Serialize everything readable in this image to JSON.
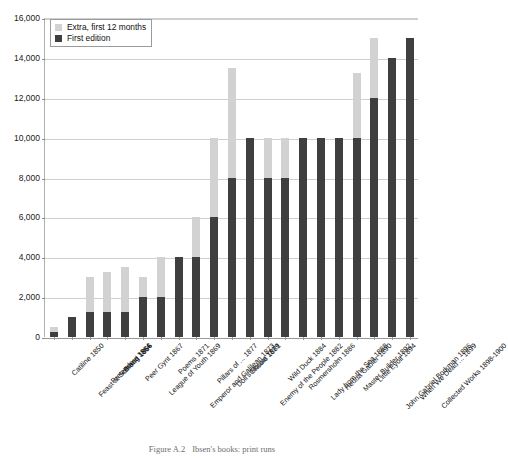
{
  "figure": {
    "caption_number": "Figure A.2",
    "caption_text": "Ibsen's books: print runs"
  },
  "legend": {
    "position": "top-left-inside",
    "items": [
      {
        "label": "Extra, first 12 months",
        "color": "#d2d2d2",
        "swatch": "legend-swatch-extra"
      },
      {
        "label": "First edition",
        "color": "#3f3f3f",
        "swatch": "legend-swatch-first"
      }
    ]
  },
  "axes": {
    "y_ticks": [
      "0",
      "2,000",
      "4,000",
      "6,000",
      "8,000",
      "10,000",
      "12,000",
      "14,000",
      "16,000"
    ],
    "y_min": 0,
    "y_max": 16000,
    "y_step": 2000,
    "grid": true
  },
  "chart_data": {
    "type": "bar",
    "subtype": "stacked-vertical",
    "title": "Ibsen's books: print runs",
    "xlabel": "",
    "ylabel": "",
    "ylim": [
      0,
      16000
    ],
    "ytick_step": 2000,
    "grid": true,
    "legend_position": "top-left-inside",
    "categories": [
      "Catiline 1850",
      "Feast at Solhoug 1856",
      "Pretenders 1864",
      "Brand 1866",
      "Peer Gynt 1867",
      "League of Youth 1869",
      "Poems 1871",
      "Emperor and Galilean 1873",
      "Pillars of ... 1877",
      "Doll's House 1879",
      "Ghosts 1881",
      "Enemy of the People 1882",
      "Wild Duck 1884",
      "Rosmersholm 1886",
      "Lady from the Sea 1888",
      "Hedda Gabler 1890",
      "Master Builder 1892",
      "Little Eyolf 1894",
      "John Gabriel Borkman 1896",
      "When We Dead ... 1899",
      "Collected Works 1898-1900"
    ],
    "series": [
      {
        "name": "First edition",
        "color": "#3f3f3f",
        "values": [
          250,
          1000,
          1250,
          1250,
          1250,
          2000,
          2000,
          4000,
          4000,
          6000,
          8000,
          10000,
          8000,
          8000,
          10000,
          10000,
          10000,
          10000,
          12000,
          14000,
          15000
        ]
      },
      {
        "name": "Extra, first 12 months",
        "color": "#d2d2d2",
        "values": [
          250,
          0,
          1750,
          2000,
          2250,
          1000,
          2000,
          0,
          2000,
          4000,
          5500,
          0,
          2000,
          2000,
          0,
          0,
          0,
          3250,
          3000,
          0,
          0
        ]
      }
    ],
    "totals": [
      500,
      1000,
      3000,
      3250,
      3500,
      3000,
      4000,
      4000,
      6000,
      10000,
      13500,
      10000,
      10000,
      10000,
      10000,
      10000,
      10000,
      13250,
      15000,
      14000,
      15000
    ]
  }
}
